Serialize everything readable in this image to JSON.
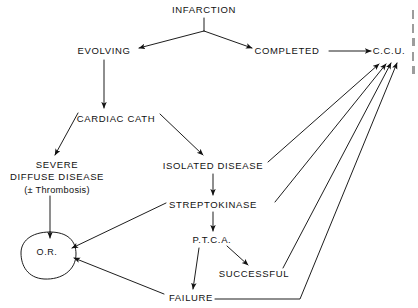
{
  "diagram": {
    "type": "flowchart",
    "ink_color": "#111111",
    "background": "#ffffff",
    "nodes": [
      {
        "id": "infarction",
        "label": "INFARCTION",
        "x": 204,
        "y": 10,
        "shape": "text"
      },
      {
        "id": "evolving",
        "label": "EVOLVING",
        "x": 104,
        "y": 51,
        "shape": "text"
      },
      {
        "id": "completed",
        "label": "COMPLETED",
        "x": 287,
        "y": 51,
        "shape": "text"
      },
      {
        "id": "ccu",
        "label": "C.C.U.",
        "x": 389,
        "y": 51,
        "shape": "text"
      },
      {
        "id": "cardiac-cath",
        "label": "CARDIAC  CATH",
        "x": 116,
        "y": 119,
        "shape": "text"
      },
      {
        "id": "severe",
        "label": "SEVERE",
        "line2": "DIFFUSE  DISEASE",
        "line3": "(± Thrombosis)",
        "x": 57,
        "y": 178,
        "shape": "text"
      },
      {
        "id": "isolated",
        "label": "ISOLATED   DISEASE",
        "x": 213,
        "y": 166,
        "shape": "text"
      },
      {
        "id": "streptokinase",
        "label": "STREPTOKINASE",
        "x": 213,
        "y": 205,
        "shape": "text"
      },
      {
        "id": "ptca",
        "label": "P.T.C.A.",
        "x": 212,
        "y": 240,
        "shape": "text"
      },
      {
        "id": "successful",
        "label": "SUCCESSFUL",
        "x": 254,
        "y": 274,
        "shape": "text"
      },
      {
        "id": "failure",
        "label": "FAILURE",
        "x": 191,
        "y": 298,
        "shape": "text"
      },
      {
        "id": "or",
        "label": "O.R.",
        "x": 49,
        "y": 253,
        "shape": "oval"
      }
    ],
    "edges": [
      {
        "from": "infarction",
        "to": "evolving",
        "style": "arrow"
      },
      {
        "from": "infarction",
        "to": "completed",
        "style": "arrow"
      },
      {
        "from": "completed",
        "to": "ccu",
        "style": "arrow"
      },
      {
        "from": "evolving",
        "to": "cardiac-cath",
        "style": "arrow"
      },
      {
        "from": "cardiac-cath",
        "to": "severe",
        "style": "arrow"
      },
      {
        "from": "cardiac-cath",
        "to": "isolated",
        "style": "arrow"
      },
      {
        "from": "severe",
        "to": "or",
        "style": "arrow"
      },
      {
        "from": "isolated",
        "to": "streptokinase",
        "style": "arrow"
      },
      {
        "from": "streptokinase",
        "to": "or",
        "style": "arrow"
      },
      {
        "from": "streptokinase",
        "to": "ptca",
        "style": "arrow"
      },
      {
        "from": "ptca",
        "to": "successful",
        "style": "arrow"
      },
      {
        "from": "ptca",
        "to": "failure",
        "style": "arrow"
      },
      {
        "from": "failure",
        "to": "or",
        "style": "arrow"
      },
      {
        "from": "isolated",
        "to": "ccu",
        "style": "arrow"
      },
      {
        "from": "streptokinase",
        "to": "ccu",
        "style": "arrow"
      },
      {
        "from": "successful",
        "to": "ccu",
        "style": "arrow"
      },
      {
        "from": "failure",
        "to": "ccu",
        "style": "arrow"
      }
    ]
  }
}
